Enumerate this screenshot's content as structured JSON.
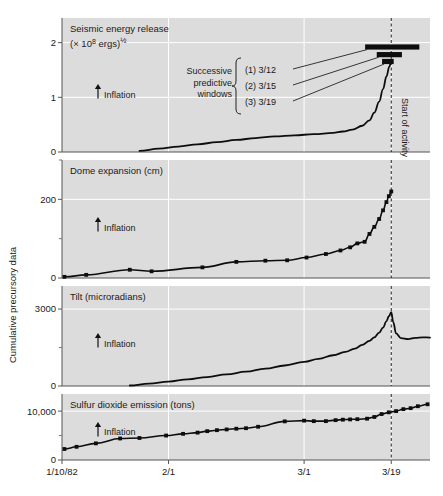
{
  "figure": {
    "ylabel": "Cumulative precursory data",
    "xaxis": {
      "ticks": [
        {
          "label": "1/10/82",
          "pos": 0
        },
        {
          "label": "2/1",
          "pos": 22
        },
        {
          "label": "3/1",
          "pos": 50
        },
        {
          "label": "3/19",
          "pos": 68
        }
      ],
      "xlim": [
        0,
        76
      ]
    },
    "event_line": {
      "label": "Start of activity",
      "pos": 68
    },
    "inflation_label": "Inflation",
    "inflation_arrow": "up-arrow-icon"
  },
  "chart_data": [
    {
      "type": "line",
      "title": "Seismic energy release",
      "subtitle": "(× 10⁸ ergs)½",
      "ylabel": "",
      "xlabel": "",
      "ylim": [
        0,
        2.45
      ],
      "yticks": [
        0,
        1,
        2
      ],
      "ytick_labels": [
        "0",
        "1",
        "2"
      ],
      "grid": true,
      "x": [
        16,
        20,
        24,
        28,
        32,
        36,
        40,
        44,
        48,
        52,
        56,
        58,
        60,
        62,
        63.5,
        64.5,
        65.5,
        66.3,
        67,
        67.6,
        68
      ],
      "values": [
        0.02,
        0.06,
        0.1,
        0.14,
        0.18,
        0.22,
        0.255,
        0.285,
        0.305,
        0.325,
        0.35,
        0.375,
        0.41,
        0.48,
        0.58,
        0.72,
        0.92,
        1.15,
        1.38,
        1.56,
        1.66
      ],
      "annotation": {
        "text": "Successive predictive windows",
        "lines": [
          "Successive",
          "predictive",
          "windows"
        ],
        "items": [
          {
            "label": "(1) 3/12",
            "bar_center": 68.2,
            "bar_half_width": 5.6,
            "y": 1.92
          },
          {
            "label": "(2) 3/15",
            "bar_center": 67.6,
            "bar_half_width": 2.6,
            "y": 1.78
          },
          {
            "label": "(3) 3/19",
            "bar_center": 67.3,
            "bar_half_width": 1.2,
            "y": 1.655
          }
        ]
      }
    },
    {
      "type": "line",
      "title": "Dome expansion (cm)",
      "ylabel": "",
      "xlabel": "",
      "ylim": [
        0,
        300
      ],
      "yticks": [
        0,
        200
      ],
      "ytick_labels": [
        "0",
        "200"
      ],
      "grid": true,
      "markers": true,
      "x": [
        0.5,
        5,
        14,
        18.5,
        29,
        36,
        42,
        46.5,
        50.5,
        54.5,
        57.5,
        59.5,
        61,
        62.5,
        63.5,
        64.5,
        65.5,
        66.3,
        67,
        67.5,
        68
      ],
      "values": [
        3,
        8,
        21,
        17,
        27,
        41,
        44,
        45,
        52,
        61,
        70,
        78,
        88,
        92,
        112,
        130,
        150,
        172,
        193,
        208,
        220
      ]
    },
    {
      "type": "line",
      "title": "Tilt (microradians)",
      "ylabel": "",
      "xlabel": "",
      "ylim": [
        0,
        3900
      ],
      "yticks": [
        0,
        3000
      ],
      "ytick_labels": [
        "0",
        "3000"
      ],
      "grid": true,
      "x": [
        14,
        18,
        22,
        26,
        30,
        34,
        38,
        42,
        46,
        50,
        53,
        56,
        58.5,
        60.5,
        62,
        63.5,
        64.5,
        65.5,
        66.3,
        67,
        67.5,
        68,
        68.4,
        69,
        70,
        71.5,
        73,
        74.5,
        76
      ],
      "values": [
        20,
        90,
        170,
        260,
        350,
        450,
        560,
        680,
        800,
        940,
        1060,
        1200,
        1330,
        1460,
        1600,
        1760,
        1900,
        2080,
        2280,
        2520,
        2720,
        2880,
        2500,
        2050,
        1870,
        1830,
        1880,
        1900,
        1890
      ]
    },
    {
      "type": "line",
      "title": "Sulfur dioxide emission (tons)",
      "ylabel": "",
      "xlabel": "",
      "ylim": [
        0,
        13500
      ],
      "yticks": [
        0,
        10000
      ],
      "ytick_labels": [
        "0",
        "10,000"
      ],
      "grid": true,
      "markers": true,
      "x": [
        0.5,
        3,
        7,
        12,
        16,
        21.5,
        25,
        28,
        30,
        32,
        34,
        36,
        38,
        40.5,
        46,
        50,
        52,
        54.5,
        56.5,
        58,
        59.5,
        61,
        63,
        64.5,
        66,
        67.5,
        69,
        70.5,
        72,
        73.5,
        75.5
      ],
      "values": [
        2250,
        2700,
        3400,
        4400,
        4500,
        5000,
        5350,
        5600,
        5900,
        6100,
        6250,
        6400,
        6500,
        6800,
        7900,
        8050,
        7950,
        7950,
        8150,
        8250,
        8300,
        8350,
        8450,
        8800,
        9400,
        9750,
        10000,
        10400,
        10600,
        11000,
        11400
      ]
    }
  ]
}
